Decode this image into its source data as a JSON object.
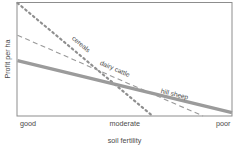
{
  "chart_data": {
    "type": "line",
    "title": "",
    "xlabel": "soil fertility",
    "ylabel": "Profit per ha",
    "x_tick_labels": [
      "good",
      "moderate",
      "poor"
    ],
    "x_tick_positions": [
      0,
      0.5,
      1
    ],
    "y_tick_labels": [],
    "xlim": [
      0,
      1
    ],
    "ylim": [
      0,
      1
    ],
    "grid": false,
    "legend_position": "inline-labels",
    "axis_frame": "box",
    "series": [
      {
        "name": "cereals",
        "label": "cereals",
        "style": "dotted",
        "color": "#8f8f8f",
        "width": 2.2,
        "x": [
          0.0,
          0.63
        ],
        "y": [
          1.0,
          0.0
        ],
        "label_x": 0.29,
        "label_y": 0.62
      },
      {
        "name": "dairy cattle",
        "label": "dairy cattle",
        "style": "dashed",
        "color": "#9a9a9a",
        "width": 1.1,
        "x": [
          0.0,
          0.865
        ],
        "y": [
          0.715,
          0.0
        ],
        "label_x": 0.45,
        "label_y": 0.4
      },
      {
        "name": "hill sheep",
        "label": "hill sheep",
        "style": "solid",
        "color": "#9b9b9b",
        "width": 3.2,
        "x": [
          0.0,
          1.0
        ],
        "y": [
          0.49,
          0.03
        ],
        "label_x": 0.73,
        "label_y": 0.175
      }
    ]
  },
  "figure": {
    "axis_color": "#8d8d8d",
    "text_color": "#4a4a4a",
    "background": "#ffffff"
  }
}
